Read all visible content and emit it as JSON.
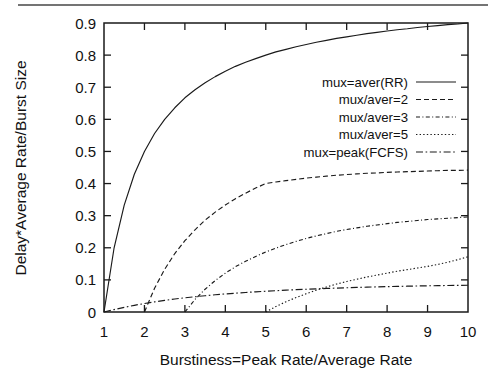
{
  "figure": {
    "kind": "line-plot",
    "background_color": "#ffffff",
    "ink_color": "#1a1a1a",
    "has_top_scan_rule": true
  },
  "chart_data": {
    "type": "line",
    "title": "",
    "subtitle": "",
    "xlabel": "Burstiness=Peak Rate/Average Rate",
    "ylabel": "Delay*Average Rate/Burst Size",
    "xlim": [
      1,
      10
    ],
    "ylim": [
      0,
      0.9
    ],
    "xticks": [
      1,
      2,
      3,
      4,
      5,
      6,
      7,
      8,
      9,
      10
    ],
    "xticklabels": [
      "1",
      "2",
      "3",
      "4",
      "5",
      "6",
      "7",
      "8",
      "9",
      "10"
    ],
    "yticks": [
      0,
      0.1,
      0.2,
      0.3,
      0.4,
      0.5,
      0.6,
      0.7,
      0.8,
      0.9
    ],
    "yticklabels": [
      "0",
      "0.1",
      "0.2",
      "0.3",
      "0.4",
      "0.5",
      "0.6",
      "0.7",
      "0.8",
      "0.9"
    ],
    "grid": false,
    "legend_position": "upper-right-inside",
    "x": [
      1,
      1.25,
      1.5,
      1.75,
      2,
      2.25,
      2.5,
      2.75,
      3,
      3.25,
      3.5,
      3.75,
      4,
      4.25,
      4.5,
      4.75,
      5,
      5.25,
      5.5,
      5.75,
      6,
      6.25,
      6.5,
      6.75,
      7,
      7.25,
      7.5,
      7.75,
      8,
      8.25,
      8.5,
      8.75,
      9,
      9.25,
      9.5,
      9.75,
      10
    ],
    "series": [
      {
        "name": "mux=aver(RR)",
        "linestyle": "solid",
        "dasharray": "",
        "values": [
          0,
          0.2,
          0.333,
          0.429,
          0.5,
          0.556,
          0.6,
          0.636,
          0.667,
          0.692,
          0.714,
          0.733,
          0.75,
          0.765,
          0.778,
          0.789,
          0.8,
          0.81,
          0.818,
          0.826,
          0.833,
          0.84,
          0.846,
          0.852,
          0.857,
          0.862,
          0.867,
          0.871,
          0.875,
          0.879,
          0.882,
          0.886,
          0.889,
          0.892,
          0.895,
          0.897,
          0.9
        ]
      },
      {
        "name": "mux/aver=2",
        "linestyle": "dashed",
        "dasharray": "5,3",
        "values": [
          null,
          null,
          null,
          null,
          0,
          0.074,
          0.133,
          0.182,
          0.222,
          0.256,
          0.286,
          0.311,
          0.333,
          0.353,
          0.37,
          0.386,
          0.4,
          0.405,
          0.409,
          0.413,
          0.417,
          0.42,
          0.423,
          0.426,
          0.428,
          0.43,
          0.432,
          0.433,
          0.435,
          0.436,
          0.437,
          0.438,
          0.439,
          0.44,
          0.441,
          0.441,
          0.442
        ]
      },
      {
        "name": "mux/aver=3",
        "linestyle": "dash-dot-dot",
        "dasharray": "4,2.4,1,2.4",
        "values": [
          null,
          null,
          null,
          null,
          null,
          null,
          null,
          null,
          0,
          0.039,
          0.071,
          0.098,
          0.121,
          0.141,
          0.158,
          0.173,
          0.187,
          0.199,
          0.21,
          0.22,
          0.229,
          0.237,
          0.244,
          0.251,
          0.257,
          0.262,
          0.267,
          0.271,
          0.275,
          0.279,
          0.282,
          0.285,
          0.288,
          0.29,
          0.292,
          0.294,
          0.296
        ]
      },
      {
        "name": "mux/aver=5",
        "linestyle": "dotted",
        "dasharray": "1.4,2.2",
        "values": [
          null,
          null,
          null,
          null,
          null,
          null,
          null,
          null,
          null,
          null,
          null,
          null,
          null,
          null,
          null,
          null,
          0,
          0.017,
          0.032,
          0.045,
          0.057,
          0.068,
          0.078,
          0.087,
          0.095,
          0.102,
          0.109,
          0.115,
          0.121,
          0.127,
          0.132,
          0.137,
          0.142,
          0.148,
          0.155,
          0.163,
          0.172
        ]
      },
      {
        "name": "mux=peak(FCFS)",
        "linestyle": "dash-dot",
        "dasharray": "7,2.6,1.6,2.6",
        "values": [
          0,
          0.0075,
          0.0145,
          0.0208,
          0.0265,
          0.0316,
          0.0362,
          0.0404,
          0.0442,
          0.0476,
          0.0507,
          0.0536,
          0.0562,
          0.0586,
          0.0608,
          0.0628,
          0.0647,
          0.0664,
          0.068,
          0.0695,
          0.0709,
          0.0722,
          0.0734,
          0.0745,
          0.0755,
          0.0765,
          0.0774,
          0.0782,
          0.079,
          0.0797,
          0.0804,
          0.081,
          0.0816,
          0.0821,
          0.0826,
          0.083,
          0.0834
        ]
      }
    ],
    "legend": [
      {
        "label": "mux=aver(RR)",
        "linestyle": "solid",
        "dasharray": ""
      },
      {
        "label": "mux/aver=2",
        "linestyle": "dashed",
        "dasharray": "5,3"
      },
      {
        "label": "mux/aver=3",
        "linestyle": "dash-dot-dot",
        "dasharray": "4,2.4,1,2.4"
      },
      {
        "label": "mux/aver=5",
        "linestyle": "dotted",
        "dasharray": "1.4,2.2"
      },
      {
        "label": "mux=peak(FCFS)",
        "linestyle": "dash-dot",
        "dasharray": "7,2.6,1.6,2.6"
      }
    ]
  }
}
